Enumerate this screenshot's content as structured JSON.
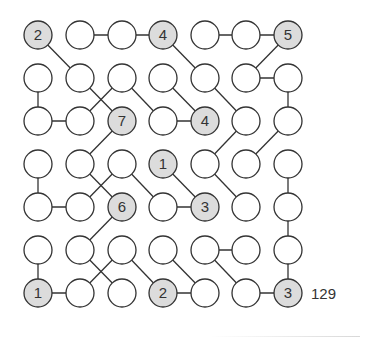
{
  "puzzle": {
    "number_label": "129",
    "rows": 7,
    "cols": 7,
    "colors": {
      "line": "#333333",
      "circle_fill": "#ffffff",
      "clue_fill": "#dcdcdc",
      "text": "#333333"
    },
    "clues": [
      {
        "r": 0,
        "c": 0,
        "value": "2"
      },
      {
        "r": 0,
        "c": 3,
        "value": "4"
      },
      {
        "r": 0,
        "c": 6,
        "value": "5"
      },
      {
        "r": 2,
        "c": 2,
        "value": "7"
      },
      {
        "r": 2,
        "c": 4,
        "value": "4"
      },
      {
        "r": 3,
        "c": 3,
        "value": "1"
      },
      {
        "r": 4,
        "c": 2,
        "value": "6"
      },
      {
        "r": 4,
        "c": 4,
        "value": "3"
      },
      {
        "r": 6,
        "c": 0,
        "value": "1"
      },
      {
        "r": 6,
        "c": 3,
        "value": "2"
      },
      {
        "r": 6,
        "c": 6,
        "value": "3"
      }
    ],
    "edges": [
      [
        [
          0,
          1
        ],
        [
          0,
          2
        ]
      ],
      [
        [
          0,
          2
        ],
        [
          0,
          3
        ]
      ],
      [
        [
          0,
          4
        ],
        [
          0,
          5
        ]
      ],
      [
        [
          0,
          5
        ],
        [
          0,
          6
        ]
      ],
      [
        [
          0,
          0
        ],
        [
          1,
          1
        ]
      ],
      [
        [
          0,
          3
        ],
        [
          1,
          4
        ]
      ],
      [
        [
          0,
          6
        ],
        [
          1,
          5
        ]
      ],
      [
        [
          1,
          0
        ],
        [
          2,
          0
        ]
      ],
      [
        [
          1,
          1
        ],
        [
          2,
          2
        ]
      ],
      [
        [
          1,
          2
        ],
        [
          2,
          1
        ]
      ],
      [
        [
          1,
          2
        ],
        [
          2,
          3
        ]
      ],
      [
        [
          1,
          3
        ],
        [
          2,
          4
        ]
      ],
      [
        [
          1,
          4
        ],
        [
          2,
          5
        ]
      ],
      [
        [
          1,
          5
        ],
        [
          1,
          6
        ]
      ],
      [
        [
          1,
          6
        ],
        [
          2,
          6
        ]
      ],
      [
        [
          2,
          0
        ],
        [
          2,
          1
        ]
      ],
      [
        [
          2,
          3
        ],
        [
          2,
          4
        ]
      ],
      [
        [
          2,
          2
        ],
        [
          3,
          1
        ]
      ],
      [
        [
          2,
          5
        ],
        [
          3,
          4
        ]
      ],
      [
        [
          2,
          6
        ],
        [
          3,
          5
        ]
      ],
      [
        [
          3,
          0
        ],
        [
          4,
          0
        ]
      ],
      [
        [
          3,
          1
        ],
        [
          4,
          2
        ]
      ],
      [
        [
          3,
          2
        ],
        [
          4,
          1
        ]
      ],
      [
        [
          3,
          2
        ],
        [
          4,
          3
        ]
      ],
      [
        [
          3,
          3
        ],
        [
          4,
          4
        ]
      ],
      [
        [
          3,
          4
        ],
        [
          4,
          5
        ]
      ],
      [
        [
          3,
          6
        ],
        [
          4,
          6
        ]
      ],
      [
        [
          4,
          0
        ],
        [
          4,
          1
        ]
      ],
      [
        [
          4,
          3
        ],
        [
          4,
          4
        ]
      ],
      [
        [
          4,
          2
        ],
        [
          5,
          1
        ]
      ],
      [
        [
          4,
          6
        ],
        [
          5,
          6
        ]
      ],
      [
        [
          5,
          0
        ],
        [
          6,
          0
        ]
      ],
      [
        [
          5,
          1
        ],
        [
          6,
          2
        ]
      ],
      [
        [
          5,
          2
        ],
        [
          6,
          1
        ]
      ],
      [
        [
          5,
          2
        ],
        [
          6,
          3
        ]
      ],
      [
        [
          5,
          3
        ],
        [
          6,
          4
        ]
      ],
      [
        [
          5,
          4
        ],
        [
          5,
          5
        ]
      ],
      [
        [
          5,
          4
        ],
        [
          6,
          5
        ]
      ],
      [
        [
          5,
          6
        ],
        [
          6,
          6
        ]
      ],
      [
        [
          6,
          0
        ],
        [
          6,
          1
        ]
      ],
      [
        [
          6,
          3
        ],
        [
          6,
          4
        ]
      ],
      [
        [
          6,
          5
        ],
        [
          6,
          6
        ]
      ]
    ]
  }
}
